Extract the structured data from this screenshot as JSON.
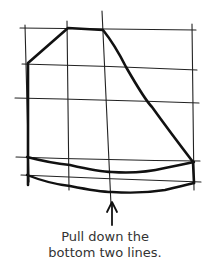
{
  "diagram": {
    "type": "hand-drawn sketch",
    "stroke_color": "#1a1a1a",
    "grid": {
      "vertical_lines_x": [
        27,
        67,
        105,
        193
      ],
      "horizontal_lines_y": [
        28,
        65,
        99,
        158,
        178
      ]
    },
    "arrow": {
      "x": 112,
      "y_tail": 225,
      "y_head": 203,
      "direction": "up"
    }
  },
  "caption": {
    "line1": "Pull down the",
    "line2": "bottom two lines."
  }
}
